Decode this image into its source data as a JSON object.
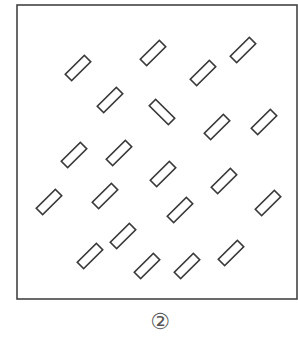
{
  "figure": {
    "caption": "②",
    "frame": {
      "x": 17,
      "y": 5,
      "width": 280,
      "height": 294,
      "stroke": "#444444"
    },
    "shape": {
      "type": "rectangle-outline",
      "length": 27,
      "thickness": 9,
      "stroke": "#3a3a3a",
      "fill": "#ffffff"
    },
    "rectangles": [
      {
        "cx": 78,
        "cy": 68,
        "angle": -45
      },
      {
        "cx": 110,
        "cy": 100,
        "angle": -45
      },
      {
        "cx": 153,
        "cy": 53,
        "angle": -45
      },
      {
        "cx": 203,
        "cy": 73,
        "angle": -45
      },
      {
        "cx": 243,
        "cy": 50,
        "angle": -45
      },
      {
        "cx": 162,
        "cy": 112,
        "angle": 45
      },
      {
        "cx": 217,
        "cy": 127,
        "angle": -45
      },
      {
        "cx": 264,
        "cy": 122,
        "angle": -45
      },
      {
        "cx": 74,
        "cy": 155,
        "angle": -45
      },
      {
        "cx": 119,
        "cy": 153,
        "angle": -45
      },
      {
        "cx": 163,
        "cy": 174,
        "angle": -45
      },
      {
        "cx": 224,
        "cy": 181,
        "angle": -45
      },
      {
        "cx": 49,
        "cy": 202,
        "angle": -45
      },
      {
        "cx": 105,
        "cy": 196,
        "angle": -45
      },
      {
        "cx": 180,
        "cy": 210,
        "angle": -45
      },
      {
        "cx": 268,
        "cy": 203,
        "angle": -45
      },
      {
        "cx": 123,
        "cy": 236,
        "angle": -45
      },
      {
        "cx": 90,
        "cy": 256,
        "angle": -45
      },
      {
        "cx": 231,
        "cy": 253,
        "angle": -45
      },
      {
        "cx": 147,
        "cy": 266,
        "angle": -45
      },
      {
        "cx": 187,
        "cy": 266,
        "angle": -45
      }
    ]
  }
}
